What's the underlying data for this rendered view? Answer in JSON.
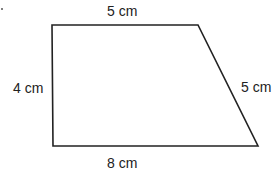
{
  "diagram": {
    "type": "trapezoid",
    "labels": {
      "top": "5 cm",
      "left": "4 cm",
      "right": "5 cm",
      "bottom": "8 cm"
    },
    "stroke_color": "#222222"
  }
}
